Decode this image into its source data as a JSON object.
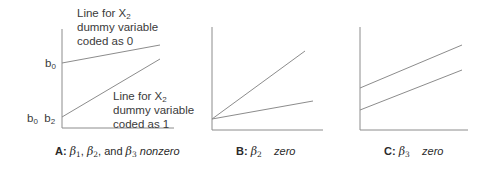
{
  "panels": [
    {
      "id": "A",
      "caption": {
        "letter": "A:",
        "symbols": [
          "β1",
          "β2",
          "β3"
        ],
        "text": "nonzero",
        "parts": [
          "β",
          "1",
          ", ",
          "β",
          "2",
          ", and ",
          "β",
          "3",
          " nonzero"
        ]
      },
      "y_labels": {
        "b0": "b",
        "b0_sub": "0",
        "b0b2_a": "b",
        "b0b2_a_sub": "0",
        "b0b2_b": "b",
        "b0b2_b_sub": "2"
      },
      "annotations": [
        {
          "line1": "Line for X",
          "line1_sub": "2",
          "line2": "dummy variable",
          "line3": "coded as 0"
        },
        {
          "line1": "Line for X",
          "line1_sub": "2",
          "line2": "dummy variable",
          "line3": "coded as 1"
        }
      ],
      "lines": [
        {
          "name": "X2=0",
          "intercept_label": "b0",
          "x1": 62,
          "y1": 63,
          "x2": 160,
          "y2": 45
        },
        {
          "name": "X2=1",
          "intercept_label": "b0 b2",
          "x1": 62,
          "y1": 117,
          "x2": 160,
          "y2": 59
        }
      ]
    },
    {
      "id": "B",
      "caption": {
        "letter": "B:",
        "symbol": "β",
        "sub": "2",
        "text": "zero"
      },
      "lines": [
        {
          "x1": 212,
          "y1": 119,
          "x2": 305,
          "y2": 51
        },
        {
          "x1": 212,
          "y1": 119,
          "x2": 313,
          "y2": 101
        }
      ]
    },
    {
      "id": "C",
      "caption": {
        "letter": "C:",
        "symbol": "β",
        "sub": "3",
        "text": "zero"
      },
      "lines": [
        {
          "x1": 360,
          "y1": 88,
          "x2": 462,
          "y2": 45
        },
        {
          "x1": 360,
          "y1": 110,
          "x2": 462,
          "y2": 70
        }
      ]
    }
  ],
  "colors": {
    "axis": "#8a8a8a",
    "line": "#8a8a8a",
    "text": "#3a3a3a"
  }
}
